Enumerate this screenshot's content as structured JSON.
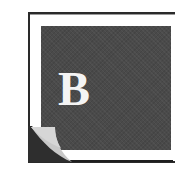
{
  "icon": {
    "name": "book-b-icon",
    "letter": "B",
    "colors": {
      "frame": "#2a2a2a",
      "panel": "#4a4a4a",
      "letter": "#f4f4f4",
      "curl_flap": "#c8c8c8",
      "curl_shadow": "#2e2e2e",
      "background": "#ffffff"
    }
  }
}
